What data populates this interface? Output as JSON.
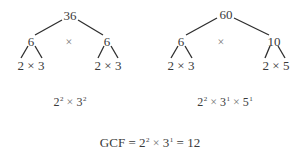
{
  "left_tree": {
    "root": "36",
    "left_child": "6",
    "right_child": "6",
    "between_operator": "×",
    "left_leaves": "2 × 3",
    "right_leaves": "2 × 3",
    "factorization": {
      "terms": [
        {
          "base": "2",
          "exp": "2"
        },
        {
          "base": "3",
          "exp": "2"
        }
      ],
      "operator": "×"
    }
  },
  "right_tree": {
    "root": "60",
    "left_child": "6",
    "right_child": "10",
    "between_operator": "×",
    "left_leaves": "2 × 3",
    "right_leaves": "2 × 5",
    "factorization": {
      "terms": [
        {
          "base": "2",
          "exp": "2"
        },
        {
          "base": "3",
          "exp": "1"
        },
        {
          "base": "5",
          "exp": "1"
        }
      ],
      "operator": "×"
    }
  },
  "gcf": {
    "label": "GCF",
    "equals": "=",
    "terms": [
      {
        "base": "2",
        "exp": "2"
      },
      {
        "base": "3",
        "exp": "1"
      }
    ],
    "operator": "×",
    "result": "12"
  }
}
